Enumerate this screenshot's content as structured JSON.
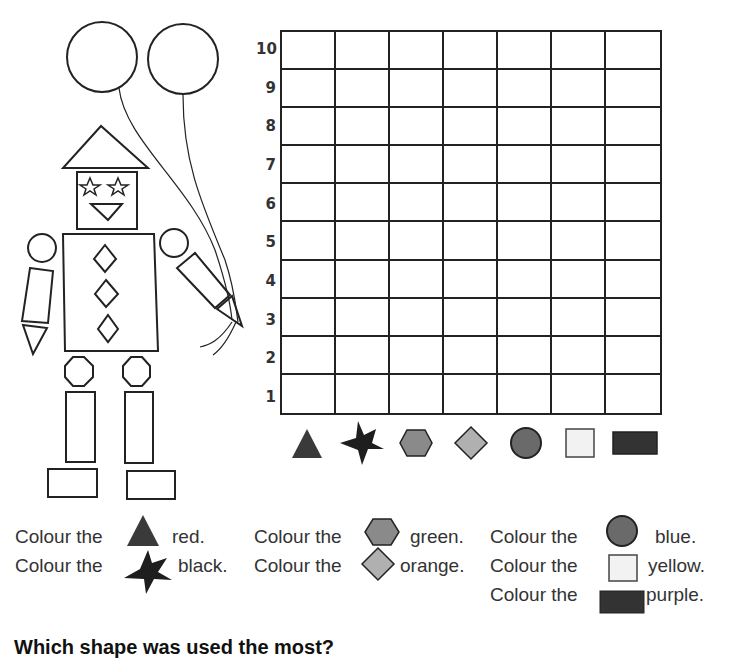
{
  "chart_data": {
    "type": "bar",
    "title": "",
    "xlabel": "",
    "ylabel": "",
    "categories": [
      "triangle",
      "star",
      "hexagon",
      "diamond",
      "circle",
      "square",
      "rectangle"
    ],
    "values": [
      0,
      0,
      0,
      0,
      0,
      0,
      0
    ],
    "ylim": [
      0,
      10
    ],
    "y_ticks": [
      "10",
      "9",
      "8",
      "7",
      "6",
      "5",
      "4",
      "3",
      "2",
      "1"
    ],
    "grid": true,
    "columns": 7,
    "rows": 10,
    "legend": "shape icons below each column"
  },
  "colors": {
    "triangle": "#3a3a3a",
    "star": "#1e1e1e",
    "hexagon": "#8a8a8a",
    "diamond": "#b0b0b0",
    "circle": "#6a6a6a",
    "square": "#f2f2f2",
    "rectangle": "#333333"
  },
  "instructions": {
    "prefix": "Colour the",
    "items": [
      {
        "shape": "triangle",
        "color_word": "red."
      },
      {
        "shape": "star",
        "color_word": "black."
      },
      {
        "shape": "hexagon",
        "color_word": "green."
      },
      {
        "shape": "diamond",
        "color_word": "orange."
      },
      {
        "shape": "circle",
        "color_word": "blue."
      },
      {
        "shape": "square",
        "color_word": "yellow."
      },
      {
        "shape": "rectangle",
        "color_word": "purple."
      }
    ]
  },
  "question": "Which shape was used the most?"
}
